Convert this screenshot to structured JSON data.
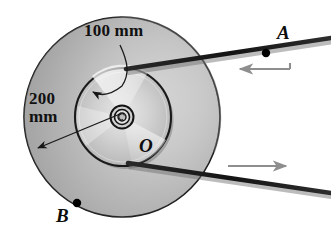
{
  "figure": {
    "kind": "engineering-mechanics-diagram",
    "background_color": "#ffffff"
  },
  "dimensions": {
    "inner_radius_label": "100 mm",
    "outer_radius_label_line1": "200",
    "outer_radius_label_line2": "mm",
    "outer_radius_label": "200 mm"
  },
  "points": {
    "a": "A",
    "o": "O",
    "b": "B"
  },
  "cords": {
    "upper": {
      "arrow_direction": "left",
      "arrow_color": "#8e8e8e"
    },
    "lower": {
      "arrow_direction": "right",
      "arrow_color": "#8e8e8e"
    }
  },
  "colors": {
    "outer_disk_light": "#cfcfcf",
    "outer_disk_mid": "#b4b4b4",
    "outer_disk_dark": "#9a9a9a",
    "inner_disk_light": "#f2f2f2",
    "inner_disk_mid": "#c9c9c9",
    "inner_disk_dark": "#a8a8a8",
    "outline": "#1a1a1a",
    "cord": "#1c1c1c",
    "arrow_gray": "#8e8e8e",
    "marker_dot": "#000000",
    "text": "#111111"
  }
}
